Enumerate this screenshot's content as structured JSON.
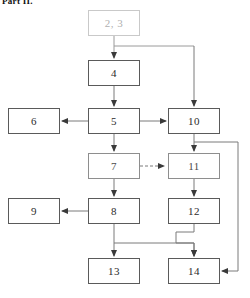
{
  "figure": {
    "caption_fragment": "Part II.",
    "type": "flowchart",
    "width": 250,
    "height": 298,
    "background": "#ffffff",
    "line_color": "#5a5a5a",
    "faded_color": "#c9c9c9",
    "text_color": "#2b2b2b"
  },
  "nodes": [
    {
      "id": "n23",
      "label": "2, 3",
      "x": 88,
      "y": 10,
      "w": 52,
      "h": 26,
      "style": "faded"
    },
    {
      "id": "n4",
      "label": "4",
      "x": 88,
      "y": 60,
      "w": 52,
      "h": 26,
      "style": "solid"
    },
    {
      "id": "n6",
      "label": "6",
      "x": 8,
      "y": 108,
      "w": 52,
      "h": 26,
      "style": "solid"
    },
    {
      "id": "n5",
      "label": "5",
      "x": 88,
      "y": 108,
      "w": 52,
      "h": 26,
      "style": "solid"
    },
    {
      "id": "n10",
      "label": "10",
      "x": 168,
      "y": 108,
      "w": 52,
      "h": 26,
      "style": "solid"
    },
    {
      "id": "n7",
      "label": "7",
      "x": 88,
      "y": 153,
      "w": 52,
      "h": 26,
      "style": "light"
    },
    {
      "id": "n11",
      "label": "11",
      "x": 168,
      "y": 153,
      "w": 52,
      "h": 26,
      "style": "light"
    },
    {
      "id": "n9",
      "label": "9",
      "x": 8,
      "y": 198,
      "w": 52,
      "h": 26,
      "style": "solid"
    },
    {
      "id": "n8",
      "label": "8",
      "x": 88,
      "y": 198,
      "w": 52,
      "h": 26,
      "style": "solid"
    },
    {
      "id": "n12",
      "label": "12",
      "x": 168,
      "y": 198,
      "w": 52,
      "h": 26,
      "style": "solid"
    },
    {
      "id": "n13",
      "label": "13",
      "x": 88,
      "y": 258,
      "w": 52,
      "h": 26,
      "style": "solid"
    },
    {
      "id": "n14",
      "label": "14",
      "x": 168,
      "y": 258,
      "w": 52,
      "h": 26,
      "style": "solid"
    }
  ],
  "edges": [
    {
      "from": "n23",
      "to": "n4",
      "style": "solid",
      "kind": "vertical"
    },
    {
      "from": "n23",
      "to": "n10",
      "style": "solid",
      "kind": "branch-right-down"
    },
    {
      "from": "n4",
      "to": "n5",
      "style": "solid",
      "kind": "vertical"
    },
    {
      "from": "n5",
      "to": "n6",
      "style": "solid",
      "kind": "horizontal-left"
    },
    {
      "from": "n5",
      "to": "n10",
      "style": "solid",
      "kind": "horizontal-right"
    },
    {
      "from": "n5",
      "to": "n7",
      "style": "solid",
      "kind": "vertical"
    },
    {
      "from": "n7",
      "to": "n11",
      "style": "dashed",
      "kind": "horizontal-right"
    },
    {
      "from": "n7",
      "to": "n8",
      "style": "solid",
      "kind": "vertical"
    },
    {
      "from": "n8",
      "to": "n9",
      "style": "solid",
      "kind": "horizontal-left"
    },
    {
      "from": "n10",
      "to": "n11",
      "style": "solid",
      "kind": "vertical"
    },
    {
      "from": "n10",
      "to": "n14",
      "style": "solid",
      "kind": "right-rail-down"
    },
    {
      "from": "n11",
      "to": "n12",
      "style": "solid",
      "kind": "vertical"
    },
    {
      "from": "n8",
      "to": "n13",
      "style": "solid",
      "kind": "branch-down"
    },
    {
      "from": "n8",
      "to": "n14",
      "style": "solid",
      "kind": "branch-right-down"
    },
    {
      "from": "n12",
      "to": "n14",
      "style": "solid",
      "kind": "vertical"
    }
  ]
}
